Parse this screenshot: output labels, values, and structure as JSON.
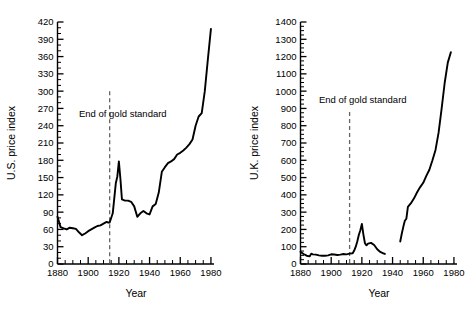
{
  "figure": {
    "background": "#ffffff",
    "line_color": "#000000",
    "axis_color": "#000000",
    "annotation_color": "#555555"
  },
  "chart_data": [
    {
      "type": "line",
      "panel": "left",
      "title": "",
      "xlabel": "Year",
      "ylabel": "U.S. price index",
      "xlim": [
        1880,
        1982
      ],
      "ylim": [
        0,
        420
      ],
      "xticks": [
        1880,
        1900,
        1920,
        1940,
        1960,
        1980
      ],
      "xtick_labels": [
        "1880",
        "1900",
        "1920",
        "1940",
        "1960",
        "1980"
      ],
      "xminor_step": 5,
      "yticks": [
        0,
        30,
        60,
        90,
        120,
        150,
        180,
        210,
        240,
        270,
        300,
        330,
        360,
        390,
        420
      ],
      "ytick_labels": [
        "0",
        "30",
        "60",
        "90",
        "120",
        "150",
        "180",
        "210",
        "240",
        "270",
        "300",
        "330",
        "360",
        "390",
        "420"
      ],
      "yminor_step": 10,
      "grid": false,
      "legend": null,
      "annotations": [
        {
          "text": "End of gold standard",
          "x": 1914,
          "line_from_y": 300,
          "line_to_y": 0,
          "style": "dashed-vertical",
          "label_x": 1894,
          "label_y": 255
        }
      ],
      "series": [
        {
          "name": "U.S. price index",
          "x": [
            1880,
            1882,
            1884,
            1886,
            1888,
            1890,
            1892,
            1894,
            1896,
            1898,
            1900,
            1902,
            1904,
            1906,
            1908,
            1910,
            1912,
            1913,
            1914,
            1916,
            1918,
            1919,
            1920,
            1921,
            1922,
            1924,
            1926,
            1928,
            1930,
            1932,
            1934,
            1936,
            1938,
            1940,
            1942,
            1944,
            1946,
            1948,
            1950,
            1952,
            1954,
            1956,
            1958,
            1960,
            1962,
            1964,
            1966,
            1968,
            1970,
            1972,
            1974,
            1976,
            1978,
            1980
          ],
          "y": [
            82,
            64,
            62,
            60,
            63,
            62,
            61,
            55,
            50,
            53,
            57,
            60,
            63,
            66,
            67,
            70,
            73,
            72,
            72,
            88,
            140,
            152,
            178,
            148,
            112,
            110,
            110,
            108,
            100,
            82,
            88,
            92,
            88,
            86,
            100,
            104,
            124,
            160,
            168,
            175,
            178,
            182,
            190,
            193,
            197,
            202,
            208,
            216,
            240,
            256,
            262,
            300,
            355,
            408
          ]
        }
      ]
    },
    {
      "type": "line",
      "panel": "right",
      "title": "",
      "xlabel": "Year",
      "ylabel": "U.K. price index",
      "xlim": [
        1880,
        1982
      ],
      "ylim": [
        0,
        1400
      ],
      "xticks": [
        1880,
        1900,
        1920,
        1940,
        1960,
        1980
      ],
      "xtick_labels": [
        "1880",
        "1900",
        "1920",
        "1940",
        "1960",
        "1980"
      ],
      "xminor_step": 5,
      "yticks": [
        0,
        100,
        200,
        300,
        400,
        500,
        600,
        700,
        800,
        900,
        1000,
        1100,
        1200,
        1300,
        1400
      ],
      "ytick_labels": [
        "0",
        "100",
        "200",
        "300",
        "400",
        "500",
        "600",
        "700",
        "800",
        "900",
        "1000",
        "1100",
        "1200",
        "1300",
        "1400"
      ],
      "yminor_step": 25,
      "grid": false,
      "legend": null,
      "annotations": [
        {
          "text": "End of gold standard",
          "x": 1912,
          "line_from_y": 880,
          "line_to_y": 0,
          "style": "dashed-vertical",
          "label_x": 1892,
          "label_y": 930
        }
      ],
      "series": [
        {
          "name": "U.K. price index (pre-war)",
          "x": [
            1880,
            1882,
            1884,
            1886,
            1887,
            1888,
            1890,
            1892,
            1894,
            1896,
            1898,
            1900,
            1902,
            1904,
            1906,
            1908,
            1910,
            1912,
            1914,
            1915,
            1916,
            1917,
            1918,
            1919,
            1920,
            1921,
            1922,
            1923,
            1924,
            1926,
            1928,
            1930,
            1932,
            1934,
            1935
          ],
          "y": [
            70,
            58,
            48,
            44,
            60,
            56,
            54,
            50,
            48,
            48,
            50,
            56,
            55,
            52,
            54,
            58,
            56,
            60,
            62,
            78,
            100,
            130,
            168,
            195,
            232,
            170,
            120,
            108,
            118,
            122,
            110,
            85,
            70,
            62,
            58
          ]
        },
        {
          "name": "U.K. price index (post-war)",
          "x": [
            1945,
            1946,
            1947,
            1948,
            1949,
            1950,
            1952,
            1954,
            1956,
            1958,
            1960,
            1962,
            1964,
            1966,
            1968,
            1970,
            1972,
            1974,
            1976,
            1978
          ],
          "y": [
            130,
            175,
            215,
            250,
            262,
            330,
            352,
            380,
            415,
            445,
            470,
            510,
            545,
            600,
            660,
            760,
            900,
            1050,
            1165,
            1225
          ]
        }
      ]
    }
  ]
}
